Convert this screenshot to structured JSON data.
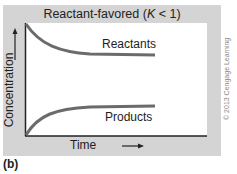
{
  "figure": {
    "title_prefix": "Reactant-favored (",
    "title_var": "K",
    "title_suffix": " < 1)",
    "y_axis_label": "Concentration",
    "y_axis_arrow": "→",
    "x_axis_label": "Time",
    "x_axis_arrow": "⟶",
    "curve_labels": {
      "reactants": "Reactants",
      "products": "Products"
    },
    "copyright": "© 2013 Cengage Learning",
    "panel_label": "(b)"
  },
  "colors": {
    "panel_bg": "#d4d4d4",
    "plot_bg": "#ffffff",
    "curve": "#6b6b6b",
    "axis": "#222222"
  }
}
